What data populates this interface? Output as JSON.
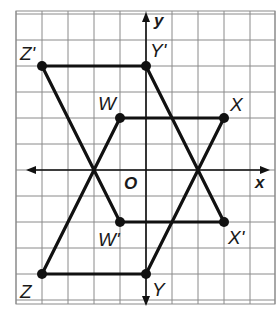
{
  "figure": {
    "type": "coordinate-plane-transformation",
    "axes": {
      "x_label": "x",
      "y_label": "y",
      "origin_label": "O"
    },
    "grid": {
      "x_range": [
        -5,
        5
      ],
      "y_range": [
        -5,
        6
      ],
      "unit": 1
    },
    "colors": {
      "grid": "#8a8a8a",
      "lines": "#111111",
      "background": "#ffffff"
    },
    "points": [
      {
        "label": "Z'",
        "x": -4,
        "y": 4
      },
      {
        "label": "Y'",
        "x": 0,
        "y": 4
      },
      {
        "label": "W",
        "x": -1,
        "y": 2
      },
      {
        "label": "X",
        "x": 3,
        "y": 2
      },
      {
        "label": "W'",
        "x": -1,
        "y": -2
      },
      {
        "label": "X'",
        "x": 3,
        "y": -2
      },
      {
        "label": "Z",
        "x": -4,
        "y": -4
      },
      {
        "label": "Y",
        "x": 0,
        "y": -4
      }
    ],
    "figures": [
      {
        "name": "WXYZ",
        "vertices": [
          "W",
          "X",
          "Y",
          "Z"
        ]
      },
      {
        "name": "W'X'Y'Z'",
        "vertices": [
          "W'",
          "X'",
          "Y'",
          "Z'"
        ]
      }
    ]
  }
}
